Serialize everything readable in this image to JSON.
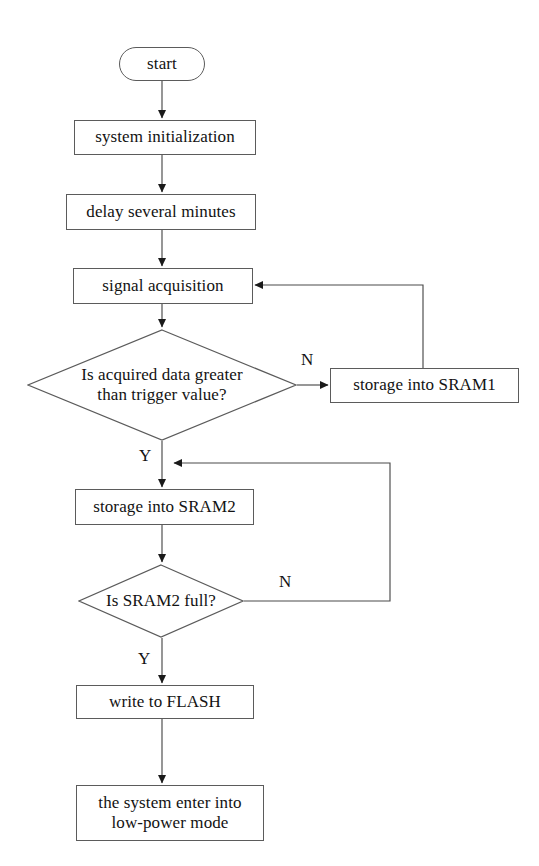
{
  "diagram": {
    "canvas": {
      "width": 539,
      "height": 866
    },
    "colors": {
      "background": "#ffffff",
      "stroke": "#5b5b5b",
      "edge": "#4a4a4a",
      "text": "#121212"
    }
  },
  "nodes": {
    "start": {
      "label": "start",
      "shape": "terminator",
      "x": 119,
      "y": 47,
      "w": 86,
      "h": 34,
      "font_size": 17
    },
    "system_init": {
      "label": "system initialization",
      "shape": "process",
      "x": 74,
      "y": 120,
      "w": 182,
      "h": 35,
      "font_size": 17
    },
    "delay": {
      "label": "delay  several minutes",
      "shape": "process",
      "x": 66,
      "y": 194,
      "w": 190,
      "h": 36,
      "font_size": 17
    },
    "signal_acq": {
      "label": "signal acquisition",
      "shape": "process",
      "x": 73,
      "y": 268,
      "w": 180,
      "h": 36,
      "font_size": 17
    },
    "decision_trigger": {
      "label": "Is acquired data greater\nthan trigger value?",
      "shape": "decision",
      "x": 27,
      "y": 329,
      "w": 270,
      "h": 112,
      "font_size": 17
    },
    "storage_sram1": {
      "label": "storage into SRAM1",
      "shape": "process",
      "x": 330,
      "y": 368,
      "w": 189,
      "h": 35,
      "font_size": 17
    },
    "storage_sram2": {
      "label": "storage into SRAM2",
      "shape": "process",
      "x": 75,
      "y": 489,
      "w": 179,
      "h": 36,
      "font_size": 17
    },
    "decision_full": {
      "label": "Is SRAM2 full?",
      "shape": "decision",
      "x": 78,
      "y": 564,
      "w": 166,
      "h": 74,
      "font_size": 17
    },
    "write_flash": {
      "label": "write to FLASH",
      "shape": "process",
      "x": 76,
      "y": 685,
      "w": 178,
      "h": 34,
      "font_size": 17
    },
    "low_power": {
      "label": "the system enter into\nlow-power mode",
      "shape": "process",
      "x": 76,
      "y": 785,
      "w": 188,
      "h": 56,
      "font_size": 17
    }
  },
  "branch_labels": {
    "trigger_no": {
      "text": "N",
      "x": 301,
      "y": 351,
      "font_size": 17
    },
    "trigger_yes": {
      "text": "Y",
      "x": 139,
      "y": 447,
      "font_size": 17
    },
    "full_no": {
      "text": "N",
      "x": 279,
      "y": 573,
      "font_size": 17
    },
    "full_yes": {
      "text": "Y",
      "x": 138,
      "y": 650,
      "font_size": 17
    }
  },
  "edges": [
    {
      "name": "start-to-init",
      "from": "start",
      "to": "system_init"
    },
    {
      "name": "init-to-delay",
      "from": "system_init",
      "to": "delay"
    },
    {
      "name": "delay-to-signal",
      "from": "delay",
      "to": "signal_acq"
    },
    {
      "name": "signal-to-trigger",
      "from": "signal_acq",
      "to": "decision_trigger"
    },
    {
      "name": "trigger-no-to-sram1",
      "from": "decision_trigger",
      "to": "storage_sram1",
      "label": "N"
    },
    {
      "name": "sram1-back-to-signal",
      "from": "storage_sram1",
      "to": "signal_acq"
    },
    {
      "name": "trigger-yes-to-sram2",
      "from": "decision_trigger",
      "to": "storage_sram2",
      "label": "Y"
    },
    {
      "name": "sram2-to-full",
      "from": "storage_sram2",
      "to": "decision_full"
    },
    {
      "name": "full-no-back-to-sram2",
      "from": "decision_full",
      "to": "storage_sram2",
      "label": "N"
    },
    {
      "name": "full-yes-to-flash",
      "from": "decision_full",
      "to": "write_flash",
      "label": "Y"
    },
    {
      "name": "flash-to-lowpower",
      "from": "write_flash",
      "to": "low_power"
    }
  ]
}
